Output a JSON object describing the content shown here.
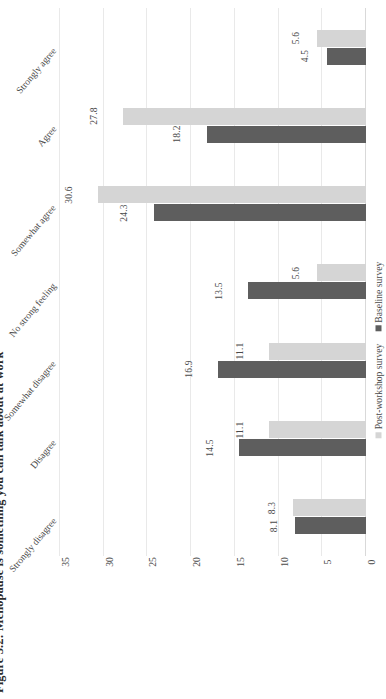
{
  "figure": {
    "label": "Figure 5.2:",
    "caption": "Menopause is something you can talk about at work",
    "full_title": "Figure 5.2: Menopause is something you can talk about at work"
  },
  "legend": {
    "position": "bottom-right",
    "items": [
      {
        "name": "Post-workshop survey",
        "color": "#d5d5d5"
      },
      {
        "name": "Baseline survey",
        "color": "#5e5e5e"
      }
    ]
  },
  "colors": {
    "series_post_workshop": "#d5d5d5",
    "series_baseline": "#5e5e5e",
    "gridline": "#e9e9e9",
    "text": "#4a4a4a",
    "title": "#2b2b2b",
    "background": "#ffffff"
  },
  "axis": {
    "ticks": [
      "0",
      "5",
      "10",
      "15",
      "20",
      "25",
      "30",
      "35"
    ],
    "min": 0,
    "max": 35,
    "step": 5
  },
  "chart_data": {
    "type": "bar",
    "orientation": "vertical-rotated",
    "title": "Figure 5.2: Menopause is something you can talk about at work",
    "xlabel": "",
    "ylabel": "",
    "ylim": [
      0,
      35
    ],
    "ytick_step": 5,
    "grid": true,
    "legend_position": "bottom-right",
    "categories": [
      "Strongly agree",
      "Agree",
      "Somewhat agree",
      "No strong feeling",
      "Somewhat disagree",
      "Disagree",
      "Strongly disagree"
    ],
    "series": [
      {
        "name": "Post-workshop survey",
        "color": "#d5d5d5",
        "values": [
          5.6,
          27.8,
          30.6,
          5.6,
          11.1,
          11.1,
          8.3
        ],
        "labels": [
          "5.6",
          "27.8",
          "30.6",
          "5.6",
          "11.1",
          "11.1",
          "8.3"
        ]
      },
      {
        "name": "Baseline survey",
        "color": "#5e5e5e",
        "values": [
          4.5,
          18.2,
          24.3,
          13.5,
          16.9,
          14.5,
          8.1
        ],
        "labels": [
          "4.5",
          "18.2",
          "24.3",
          "13.5",
          "16.9",
          "14.5",
          "8.1"
        ]
      }
    ]
  }
}
